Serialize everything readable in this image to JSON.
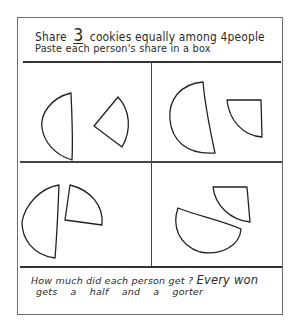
{
  "worksheet": {
    "instruction_line1_prefix": "Share",
    "cookie_count": "3",
    "instruction_line1_suffix": "cookies equally among 4people",
    "instruction_line2": "Paste each person's share in a box",
    "question": "How much did each person get ?",
    "answer_part1": "Every won",
    "answer_line2": "gets a half and a gorter"
  },
  "boxes": [
    {
      "id": "top-left",
      "pieces": [
        "half-cookie",
        "quarter-cookie"
      ]
    },
    {
      "id": "top-right",
      "pieces": [
        "half-cookie",
        "quarter-cookie"
      ]
    },
    {
      "id": "bottom-left",
      "pieces": [
        "half-cookie",
        "quarter-cookie"
      ]
    },
    {
      "id": "bottom-right",
      "pieces": [
        "half-cookie",
        "quarter-cookie"
      ]
    }
  ],
  "colors": {
    "ink": "#222222",
    "paper": "#ffffff",
    "border": "#6a6a6a"
  }
}
